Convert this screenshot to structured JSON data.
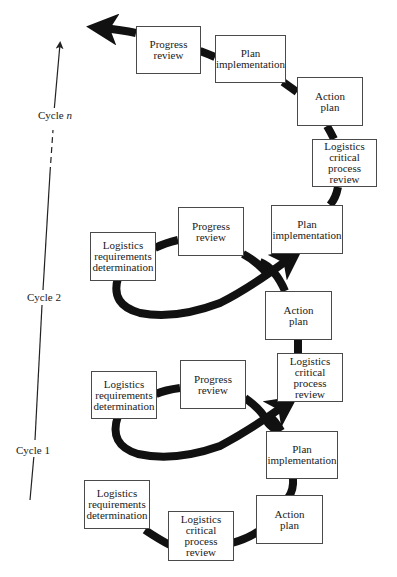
{
  "diagram": {
    "cycles": [
      {
        "label": "Cycle 1",
        "steps": [
          "Logistics requirements determination",
          "Logistics critical process review",
          "Action plan",
          "Plan implementation",
          "Progress review"
        ]
      },
      {
        "label": "Cycle 2",
        "steps": [
          "Logistics requirements determination",
          "Progress review",
          "Plan implementation",
          "Action plan",
          "Logistics critical process review"
        ]
      },
      {
        "label_prefix": "Cycle",
        "label_var": "n",
        "steps": [
          "Logistics critical process review",
          "Action plan",
          "Plan implementation",
          "Progress review"
        ]
      }
    ],
    "boxes": {
      "c1_req": "Logistics\nrequirements\ndetermination",
      "c1_crit": "Logistics\ncritical\nprocess\nreview",
      "c1_action": "Action\nplan",
      "c1_impl": "Plan\nimplementation",
      "c1_progress": "Progress\nreview",
      "c1_req_upper": "Logistics\nrequirements\ndetermination",
      "c1_crit_upper": "Logistics\ncritical\nprocess\nreview",
      "c2_action": "Action\nplan",
      "c2_req": "Logistics\nrequirements\ndetermination",
      "c2_progress": "Progress\nreview",
      "c2_impl": "Plan\nimplementation",
      "cn_crit": "Logistics\ncritical\nprocess\nreview",
      "cn_action": "Action\nplan",
      "cn_impl": "Plan\nimplementation",
      "cn_progress": "Progress\nreview"
    },
    "axis_labels": {
      "cycle1": "Cycle 1",
      "cycle2": "Cycle 2",
      "cyclen_prefix": "Cycle ",
      "cyclen_var": "n"
    },
    "colors": {
      "path": "#111111",
      "box_border": "#4a4a4a",
      "axis": "#222222"
    }
  }
}
